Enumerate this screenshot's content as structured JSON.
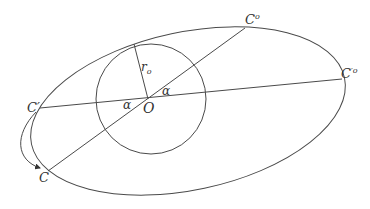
{
  "diagram": {
    "title": "",
    "colors": {
      "stroke": "#4a4a4a",
      "text": "#333333",
      "background": "#ffffff"
    },
    "shapes": {
      "outer_ellipse": {
        "cx": 188,
        "cy": 111,
        "rx": 160,
        "ry": 79,
        "rotation_deg": -12
      },
      "inner_circle": {
        "cx": 151,
        "cy": 99,
        "r": 55
      },
      "line_c_prime_to_c_prime_o": {
        "x1": 40,
        "y1": 108,
        "x2": 342,
        "y2": 79
      },
      "line_c_to_c_o": {
        "x1": 48,
        "y1": 171,
        "x2": 245,
        "y2": 28
      },
      "radius_line": {
        "x1": 148,
        "y1": 99,
        "x2": 134,
        "y2": 44
      },
      "rotation_arrow": {
        "from": "C'",
        "to": "C"
      }
    },
    "labels": {
      "c_o": {
        "main": "C",
        "sup": "o"
      },
      "c_prime_o": {
        "main": "C",
        "sup": "′o"
      },
      "c_prime": {
        "main": "C′"
      },
      "c": {
        "main": "C"
      },
      "center_o": {
        "main": "O"
      },
      "radius": {
        "main": "r",
        "sub": "o"
      },
      "alpha_left": "α",
      "alpha_right": "α"
    }
  }
}
